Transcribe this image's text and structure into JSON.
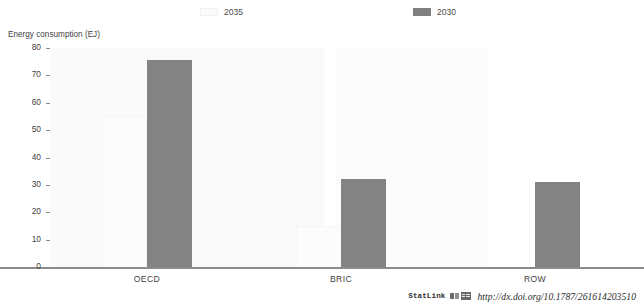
{
  "chart_data": {
    "type": "bar",
    "xlabel": "",
    "ylabel": "Energy consumption (EJ)",
    "categories": [
      "OECD",
      "BRIC",
      "ROW"
    ],
    "ylim": [
      0,
      80
    ],
    "yticks": [
      0,
      10,
      20,
      30,
      40,
      50,
      60,
      70,
      80
    ],
    "ytick_labels": [
      "0",
      "10",
      "20",
      "30",
      "40",
      "50",
      "60",
      "70",
      "80"
    ],
    "grid": false,
    "legend_position": "top",
    "series": [
      {
        "name": "2035",
        "color": "#fcfcfc",
        "values": [
          55,
          15,
          0
        ]
      },
      {
        "name": "2030",
        "color": "#838383",
        "values": [
          75.5,
          32,
          31
        ]
      }
    ]
  },
  "legend": {
    "items": [
      {
        "label": "2035",
        "swatch": "light-swatch"
      },
      {
        "label": "2030",
        "swatch": "dark-swatch"
      }
    ]
  },
  "footer": {
    "statlink_word": "StatLink",
    "statlink_icon": "spreadsheet-icon",
    "url": "http://dx.doi.org/10.1787/261614203510"
  }
}
